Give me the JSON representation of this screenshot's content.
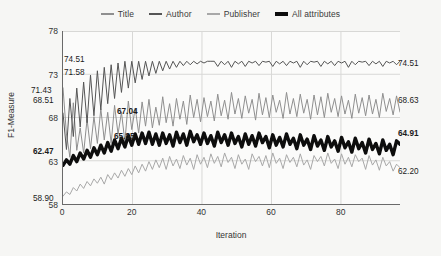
{
  "chart_data": {
    "type": "line",
    "title": "",
    "xlabel": "Iteration",
    "ylabel": "F1-Measure",
    "xlim": [
      0,
      97
    ],
    "ylim": [
      58,
      78
    ],
    "xticks": [
      0,
      20,
      40,
      60,
      80
    ],
    "yticks": [
      58,
      63,
      68,
      73,
      78
    ],
    "grid": true,
    "legend_position": "top-center",
    "series": [
      {
        "name": "Title",
        "color": "#8f8f8f",
        "width": 1.0,
        "start_value": 71.43,
        "end_value": 68.63,
        "values": [
          71.43,
          66.1,
          63.4,
          69.7,
          64.2,
          66.8,
          63.9,
          67.8,
          64.4,
          68.1,
          65.0,
          69.0,
          65.4,
          68.6,
          65.0,
          69.4,
          66.1,
          68.6,
          65.2,
          69.9,
          66.6,
          69.1,
          66.2,
          69.8,
          67.0,
          70.1,
          66.8,
          69.2,
          67.1,
          70.4,
          67.4,
          69.6,
          67.0,
          70.2,
          67.8,
          69.9,
          67.2,
          70.6,
          68.0,
          70.1,
          67.5,
          70.3,
          68.1,
          69.9,
          67.6,
          70.7,
          68.2,
          70.0,
          67.8,
          70.9,
          68.4,
          70.2,
          67.9,
          70.5,
          68.5,
          70.1,
          67.7,
          70.8,
          68.3,
          70.3,
          68.0,
          70.6,
          68.6,
          70.0,
          67.9,
          70.9,
          68.4,
          70.2,
          68.1,
          70.7,
          68.5,
          70.1,
          67.8,
          70.6,
          68.3,
          70.4,
          68.0,
          70.8,
          68.6,
          70.2,
          68.1,
          70.5,
          68.4,
          70.0,
          67.9,
          70.7,
          68.5,
          70.3,
          68.2,
          70.6,
          68.4,
          70.1,
          68.0,
          70.8,
          68.7,
          70.2,
          68.3,
          70.5,
          68.63
        ]
      },
      {
        "name": "Author",
        "color": "#555555",
        "width": 1.0,
        "start_value": 68.51,
        "end_value": 74.51,
        "values": [
          68.51,
          64.3,
          70.2,
          65.8,
          71.4,
          66.9,
          72.1,
          67.4,
          72.9,
          68.2,
          73.4,
          68.9,
          73.8,
          69.6,
          74.1,
          70.2,
          74.3,
          70.9,
          74.5,
          71.4,
          74.5,
          72.0,
          74.5,
          72.4,
          74.5,
          72.8,
          74.5,
          73.1,
          74.5,
          73.4,
          74.5,
          73.6,
          74.5,
          73.8,
          74.5,
          74.0,
          74.5,
          74.1,
          74.5,
          74.2,
          74.5,
          74.3,
          74.5,
          74.5,
          74.5,
          73.9,
          74.5,
          74.1,
          74.5,
          73.8,
          74.5,
          74.2,
          74.5,
          73.9,
          74.5,
          74.3,
          74.5,
          74.0,
          74.5,
          74.4,
          74.5,
          73.9,
          74.5,
          74.2,
          74.5,
          74.0,
          74.5,
          74.3,
          74.5,
          73.8,
          74.5,
          74.1,
          74.5,
          74.4,
          74.5,
          73.9,
          74.5,
          74.2,
          74.5,
          74.0,
          74.5,
          74.3,
          74.5,
          73.8,
          74.5,
          74.1,
          74.5,
          74.4,
          74.5,
          74.0,
          74.5,
          74.2,
          74.5,
          73.9,
          74.5,
          74.3,
          74.5,
          74.1,
          74.51
        ]
      },
      {
        "name": "Publisher",
        "color": "#a8a8a8",
        "width": 1.0,
        "start_value": 58.9,
        "end_value": 62.2,
        "values": [
          58.9,
          59.4,
          59.1,
          59.9,
          59.5,
          60.3,
          59.8,
          60.6,
          60.1,
          60.9,
          60.4,
          61.1,
          60.3,
          61.4,
          60.8,
          61.6,
          61.0,
          61.9,
          61.2,
          62.1,
          61.4,
          62.4,
          61.6,
          62.6,
          61.8,
          62.9,
          62.0,
          63.1,
          62.2,
          63.3,
          62.0,
          63.5,
          62.4,
          63.2,
          62.1,
          63.6,
          62.5,
          63.3,
          62.0,
          63.7,
          62.6,
          63.4,
          62.2,
          63.8,
          62.7,
          63.5,
          62.3,
          63.9,
          62.8,
          63.4,
          62.1,
          63.7,
          62.6,
          63.2,
          62.0,
          63.8,
          62.9,
          63.5,
          62.4,
          63.6,
          62.2,
          63.9,
          62.7,
          63.3,
          62.1,
          63.7,
          62.8,
          63.4,
          62.3,
          63.8,
          62.5,
          63.1,
          62.0,
          63.6,
          62.9,
          63.5,
          62.4,
          63.9,
          62.7,
          63.2,
          62.1,
          63.8,
          62.6,
          63.4,
          62.3,
          63.7,
          62.9,
          63.3,
          62.0,
          63.6,
          62.5,
          63.1,
          61.9,
          63.4,
          62.4,
          62.9,
          61.8,
          62.6,
          62.2
        ]
      },
      {
        "name": "All attributes",
        "color": "#0d0d0d",
        "width": 3.4,
        "start_value": 62.47,
        "end_value": 64.91,
        "values": [
          62.47,
          63.1,
          62.6,
          63.6,
          62.9,
          63.9,
          63.2,
          64.2,
          63.4,
          64.5,
          63.7,
          64.8,
          63.9,
          65.1,
          64.1,
          65.4,
          64.4,
          65.6,
          64.6,
          65.9,
          64.8,
          66.1,
          64.9,
          66.2,
          65.0,
          66.3,
          64.9,
          66.1,
          64.8,
          66.2,
          65.0,
          66.0,
          64.7,
          66.3,
          65.1,
          66.1,
          64.8,
          66.4,
          65.2,
          66.0,
          64.9,
          66.2,
          65.0,
          65.9,
          64.7,
          66.3,
          65.1,
          66.0,
          64.8,
          66.2,
          65.0,
          65.8,
          64.6,
          66.1,
          64.9,
          65.9,
          64.7,
          66.2,
          65.1,
          65.8,
          64.5,
          66.0,
          64.8,
          65.7,
          64.6,
          66.1,
          64.9,
          65.6,
          64.4,
          66.0,
          64.8,
          65.5,
          64.3,
          65.9,
          64.7,
          65.4,
          64.2,
          65.8,
          64.6,
          65.3,
          64.1,
          65.7,
          64.5,
          65.2,
          64.0,
          65.6,
          64.4,
          65.1,
          63.9,
          65.5,
          64.3,
          65.0,
          63.8,
          65.4,
          64.2,
          64.9,
          63.7,
          65.3,
          64.91
        ]
      }
    ],
    "annotations": [
      {
        "label": "74.51",
        "side": "left",
        "x": 64,
        "y": 56,
        "bold": false
      },
      {
        "label": "71.58",
        "side": "left",
        "x": 64,
        "y": 69,
        "bold": false
      },
      {
        "label": "71.43",
        "side": "left",
        "x": 31,
        "y": 87,
        "bold": false
      },
      {
        "label": "68.51",
        "side": "left",
        "x": 33,
        "y": 97,
        "bold": false
      },
      {
        "label": "67.04",
        "side": "mid",
        "x": 117,
        "y": 108,
        "bold": true
      },
      {
        "label": "65.85",
        "side": "mid",
        "x": 114,
        "y": 133,
        "bold": true
      },
      {
        "label": "62.47",
        "side": "left",
        "x": 33,
        "y": 148,
        "bold": true
      },
      {
        "label": "58.90",
        "side": "left",
        "x": 33,
        "y": 195,
        "bold": false
      },
      {
        "label": "74.51",
        "side": "right",
        "x": 398,
        "y": 60,
        "bold": false
      },
      {
        "label": "68.63",
        "side": "right",
        "x": 398,
        "y": 97,
        "bold": false
      },
      {
        "label": "64.91",
        "side": "right",
        "x": 398,
        "y": 130,
        "bold": true
      },
      {
        "label": "62.20",
        "side": "right",
        "x": 398,
        "y": 168,
        "bold": false
      }
    ]
  },
  "colors": {
    "background": "#f6f6f4",
    "plot_background": "#fbfbfa",
    "axis": "#6a6a6a",
    "grid": "#d8d8d6",
    "text": "#333333"
  }
}
